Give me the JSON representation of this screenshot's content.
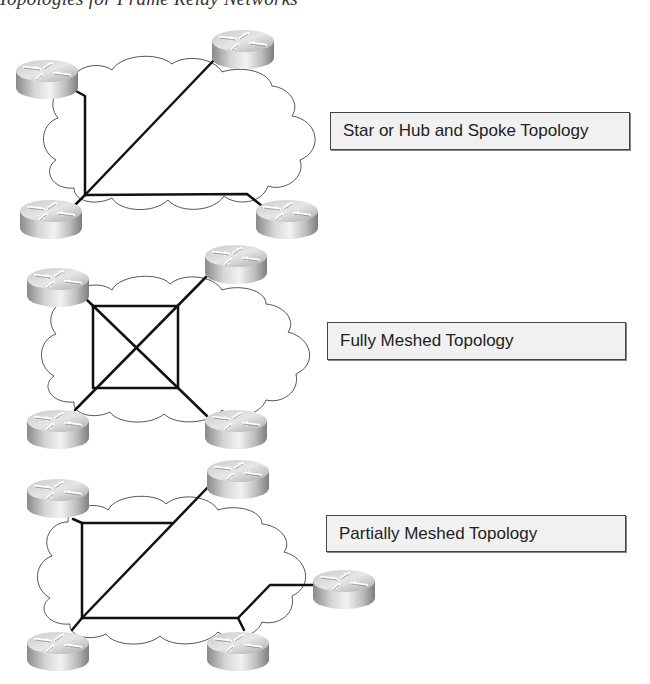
{
  "figure": {
    "caption_fragment": "Topologies for Frame Relay Networks"
  },
  "topologies": [
    {
      "id": "star",
      "label": "Star or Hub and Spoke Topology",
      "routers": 4,
      "links": [
        [
          "hub-bottom-left",
          "top-left"
        ],
        [
          "hub-bottom-left",
          "top-right"
        ],
        [
          "hub-bottom-left",
          "bottom-right"
        ]
      ]
    },
    {
      "id": "full-mesh",
      "label": "Fully Meshed Topology",
      "routers": 4,
      "links": [
        [
          "top-left",
          "top-right"
        ],
        [
          "top-left",
          "bottom-left"
        ],
        [
          "top-left",
          "bottom-right"
        ],
        [
          "top-right",
          "bottom-left"
        ],
        [
          "top-right",
          "bottom-right"
        ],
        [
          "bottom-left",
          "bottom-right"
        ]
      ]
    },
    {
      "id": "partial-mesh",
      "label": "Partially Meshed Topology",
      "routers": 5,
      "links": [
        [
          "bottom-left",
          "top-left"
        ],
        [
          "top-left",
          "top-right"
        ],
        [
          "bottom-left",
          "top-right"
        ],
        [
          "bottom-left",
          "bottom-right"
        ],
        [
          "bottom-right",
          "right"
        ]
      ]
    }
  ],
  "colors": {
    "line": "#111111",
    "cloud_stroke": "#555555",
    "label_fill": "#f1f1f1",
    "label_border": "#444444"
  }
}
